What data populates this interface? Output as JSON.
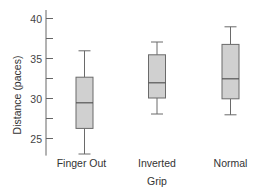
{
  "chart_data": {
    "type": "boxplot",
    "title": "",
    "xlabel": "Grip",
    "ylabel": "Distance (paces)",
    "ylim": [
      22.8,
      41
    ],
    "yticks": [
      25,
      27.5,
      30,
      32.5,
      35,
      37.5,
      40
    ],
    "ytick_labels": [
      "25",
      "",
      "30",
      "",
      "35",
      "",
      "40"
    ],
    "grid": false,
    "categories": [
      "Finger Out",
      "Inverted",
      "Normal"
    ],
    "series": [
      {
        "name": "Finger Out",
        "min": 23.0,
        "q1": 26.2,
        "median": 29.4,
        "q3": 32.6,
        "max": 35.9
      },
      {
        "name": "Inverted",
        "min": 28.0,
        "q1": 30.0,
        "median": 31.9,
        "q3": 35.4,
        "max": 37.0
      },
      {
        "name": "Normal",
        "min": 27.9,
        "q1": 29.9,
        "median": 32.4,
        "q3": 36.7,
        "max": 38.9
      }
    ],
    "colors": {
      "box_fill": "#d0d0d0",
      "box_stroke": "#6a6a6a",
      "axis": "#666666"
    }
  }
}
